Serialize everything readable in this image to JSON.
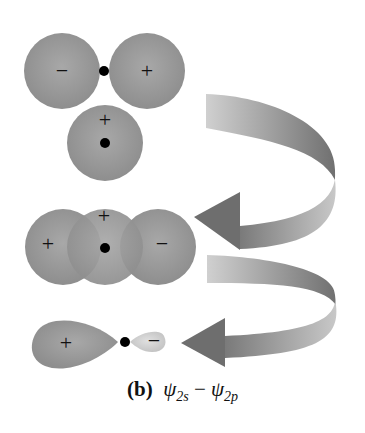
{
  "figure": {
    "label": "(b)",
    "caption_parts": {
      "psi1": "ψ",
      "sub1": "2s",
      "operator": "−",
      "psi2": "ψ",
      "sub2": "2p"
    },
    "colors": {
      "orbital_fill": "#9c9c9c",
      "orbital_light": "#d2d2d2",
      "arrow_dark": "#6e6e6e",
      "arrow_light": "#c8c8c8",
      "nucleus": "#000000"
    }
  },
  "panels": {
    "p_orbital": {
      "left_lobe_sign": "−",
      "right_lobe_sign": "+"
    },
    "s_orbital": {
      "sign": "+"
    },
    "overlap": {
      "left_sign": "+",
      "center_sign": "+",
      "right_sign": "−"
    },
    "hybrid": {
      "large_lobe_sign": "+",
      "small_lobe_sign": "−"
    }
  }
}
